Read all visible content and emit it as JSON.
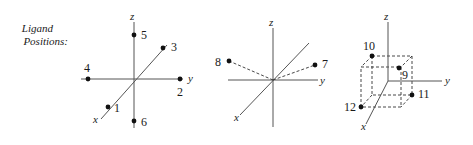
{
  "title": {
    "line1": "Ligand",
    "line2": "Positions:"
  },
  "diagrams": [
    {
      "name": "octahedral-positions",
      "axes": {
        "x": "x",
        "y": "y",
        "z": "z"
      },
      "points": [
        {
          "label": "1",
          "position": "+x"
        },
        {
          "label": "2",
          "position": "+y"
        },
        {
          "label": "3",
          "position": "-x"
        },
        {
          "label": "4",
          "position": "-y"
        },
        {
          "label": "5",
          "position": "+z"
        },
        {
          "label": "6",
          "position": "-z"
        }
      ]
    },
    {
      "name": "linear-bent-positions",
      "axes": {
        "x": "x",
        "y": "y",
        "z": "z"
      },
      "points": [
        {
          "label": "7",
          "position": "upper-right"
        },
        {
          "label": "8",
          "position": "upper-left"
        }
      ]
    },
    {
      "name": "tetrahedral-cube-positions",
      "axes": {
        "x": "x",
        "y": "y",
        "z": "z"
      },
      "points": [
        {
          "label": "9",
          "position": "cube-corner-back-top"
        },
        {
          "label": "10",
          "position": "cube-corner-front-top-left"
        },
        {
          "label": "11",
          "position": "cube-corner-bottom-right"
        },
        {
          "label": "12",
          "position": "cube-corner-front-bottom-left"
        }
      ]
    }
  ]
}
